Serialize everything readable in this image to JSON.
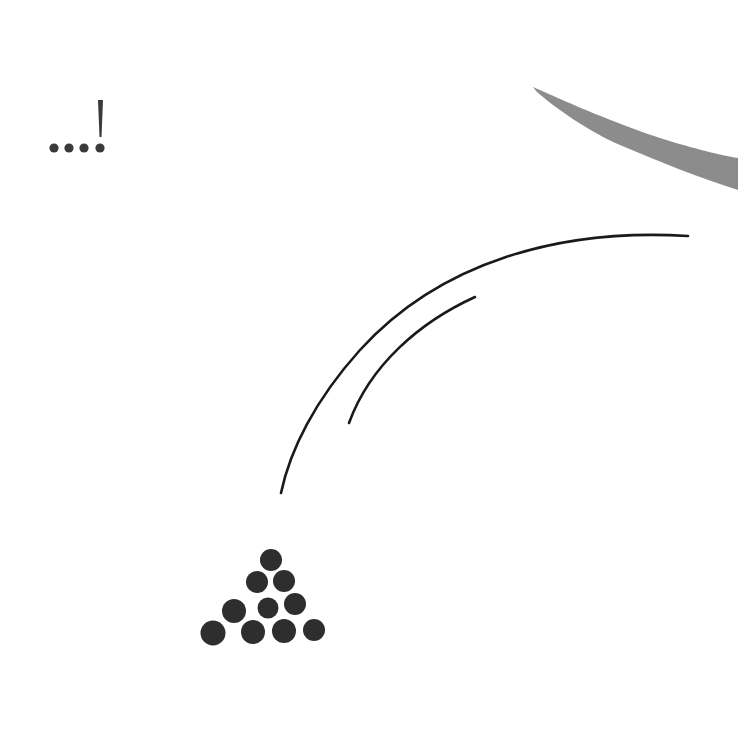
{
  "title_text": "...!",
  "colors": {
    "background": "#ffffff",
    "text": "#3a3a3a",
    "swoosh": "#8c8c8c",
    "arcs": "#1a1a1a",
    "dots": "#2e2e2e"
  },
  "elements": {
    "ellipsis_exclamation": {
      "label": "...!"
    },
    "swoosh": {
      "label": "gray curved swoosh shape"
    },
    "outer_arc": {
      "label": "outer curved line"
    },
    "inner_arc": {
      "label": "inner curved line"
    },
    "dot_triangle": {
      "label": "triangle of ten dots",
      "count": 10
    }
  }
}
